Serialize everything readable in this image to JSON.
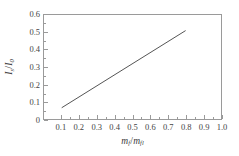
{
  "chart_data": {
    "type": "line",
    "title": "",
    "subtitle": "",
    "xlabel": "m_f/m_fl",
    "ylabel": "I_s/I_0",
    "xlabel_parts": {
      "num_var": "m",
      "num_sub": "f",
      "den_var": "m",
      "den_sub": "fl"
    },
    "ylabel_parts": {
      "num_var": "I",
      "num_sub": "s",
      "den_var": "I",
      "den_sub": "0"
    },
    "xlim": [
      0.0,
      1.0
    ],
    "ylim": [
      0.0,
      0.6
    ],
    "xticks": [
      0.1,
      0.2,
      0.3,
      0.4,
      0.5,
      0.6,
      0.7,
      0.8,
      0.9,
      1.0
    ],
    "xticklabels": [
      "0.1",
      "0.2",
      "0.3",
      "0.4",
      "0.5",
      "0.6",
      "0.7",
      "0.8",
      "0.9",
      "1.0"
    ],
    "yticks": [
      0.0,
      0.1,
      0.2,
      0.3,
      0.4,
      0.5,
      0.6
    ],
    "yticklabels": [
      "0",
      "0.1",
      "0.2",
      "0.3",
      "0.4",
      "0.5",
      "0.6"
    ],
    "xminorticks": [
      0.15,
      0.25,
      0.35,
      0.45,
      0.55,
      0.65,
      0.75,
      0.85,
      0.95
    ],
    "yminorticks": [
      0.05,
      0.15,
      0.25,
      0.35,
      0.45,
      0.55
    ],
    "grid": false,
    "legend": false,
    "tick_direction": "in",
    "frame_color": "#9a9a9a",
    "line_color": "#555555",
    "line_width": 1,
    "series": [
      {
        "name": "",
        "x": [
          0.1,
          0.8
        ],
        "y": [
          0.065,
          0.51
        ]
      }
    ]
  }
}
